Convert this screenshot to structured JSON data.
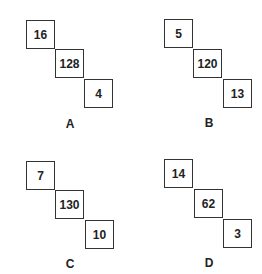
{
  "figures": [
    {
      "label": "A",
      "top": "16",
      "middle": "128",
      "bottom": "4"
    },
    {
      "label": "B",
      "top": "5",
      "middle": "120",
      "bottom": "13"
    },
    {
      "label": "C",
      "top": "7",
      "middle": "130",
      "bottom": "10"
    },
    {
      "label": "D",
      "top": "14",
      "middle": "62",
      "bottom": "3"
    }
  ]
}
